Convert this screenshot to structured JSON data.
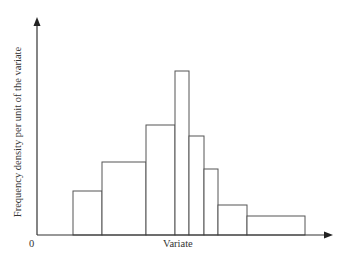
{
  "chart_data": {
    "type": "bar",
    "subtype": "histogram",
    "title": "",
    "xlabel": "Variate",
    "ylabel": "Frequency density per unit of the variate",
    "origin_label": "0",
    "grid": false,
    "legend": null,
    "bins": [
      {
        "x0": 73,
        "x1": 102,
        "height": 44
      },
      {
        "x0": 102,
        "x1": 146,
        "height": 73
      },
      {
        "x0": 146,
        "x1": 175,
        "height": 110
      },
      {
        "x0": 175,
        "x1": 189,
        "height": 164
      },
      {
        "x0": 189,
        "x1": 204,
        "height": 99
      },
      {
        "x0": 204,
        "x1": 218,
        "height": 66
      },
      {
        "x0": 218,
        "x1": 247,
        "height": 30
      },
      {
        "x0": 247,
        "x1": 305,
        "height": 19
      }
    ],
    "axis": {
      "origin_x": 37,
      "baseline_y": 235,
      "x_end": 333,
      "y_top": 17
    },
    "colors": {
      "stroke": "#555555",
      "fill": "#ffffff",
      "axis": "#333333"
    }
  }
}
